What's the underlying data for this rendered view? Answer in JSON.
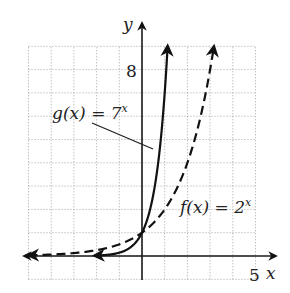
{
  "chart_data": {
    "type": "line",
    "title": "",
    "xlabel": "x",
    "ylabel": "y",
    "xlim": [
      -5,
      5
    ],
    "ylim": [
      -1,
      9
    ],
    "grid": true,
    "tick_labels": {
      "x": [
        "5"
      ],
      "y": [
        "8"
      ]
    },
    "series": [
      {
        "name": "g(x) = 7^x",
        "label_main": "g(x) = 7",
        "label_exp": "x",
        "style": "solid",
        "base": 7,
        "x": [
          -2,
          -1,
          0,
          0.5,
          1,
          1.13
        ],
        "values": [
          0.02,
          0.14,
          1,
          2.65,
          7,
          9.0
        ]
      },
      {
        "name": "f(x) = 2^x",
        "label_main": "f(x) = 2",
        "label_exp": "x",
        "style": "dashed",
        "base": 2,
        "x": [
          -5,
          -3,
          -1,
          0,
          1,
          2,
          3,
          3.17
        ],
        "values": [
          0.03,
          0.13,
          0.5,
          1,
          2,
          4,
          8,
          9.0
        ]
      }
    ],
    "annotations": [
      {
        "text": "g(x) = 7^x",
        "points_to": "g curve near (0.5, 4.7)"
      },
      {
        "text": "f(x) = 2^x",
        "points_to": "f curve"
      }
    ]
  },
  "labels": {
    "x_axis": "x",
    "y_axis": "y",
    "x_tick": "5",
    "y_tick": "8",
    "g_main": "g(x) = 7",
    "g_exp": "x",
    "f_main": "f(x) = 2",
    "f_exp": "x"
  },
  "colors": {
    "curve": "#111111",
    "axis": "#1a1a1a",
    "grid": "#9a9a9a",
    "background": "#ffffff"
  }
}
